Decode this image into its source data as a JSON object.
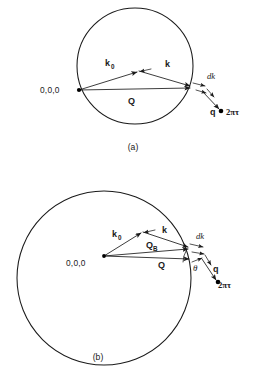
{
  "figure": {
    "background_color": "#ffffff",
    "stroke_color": "#1a1a1a",
    "width": 266,
    "height": 366
  },
  "panels": [
    {
      "id": "a",
      "caption": "(a)",
      "description": "Ewald construction with small sphere: incident wave vector k0 and scattered wave vector k from the origin, scattering vector Q, and deviation vector q to the reciprocal lattice point 2pi tau which lies outside the sphere.",
      "circle": {
        "cx": 135,
        "cy": 66,
        "r": 58
      },
      "origin": {
        "x": 79,
        "y": 90,
        "label": "0,0,0"
      },
      "apex": {
        "x": 139,
        "y": 71
      },
      "tip": {
        "x": 192,
        "y": 87
      },
      "lattice_point": {
        "x": 222,
        "y": 111,
        "label": "2πτ"
      },
      "labels": {
        "k0": "k",
        "k0_sub": "0",
        "k": "k",
        "Q": "Q",
        "dk": "dk",
        "q": "q",
        "origin": "0,0,0",
        "lattice": "2πτ"
      }
    },
    {
      "id": "b",
      "caption": "(b)",
      "description": "Ewald construction with large sphere: incident wave vector k0 and scattered wave vector k, Bragg scattering vector Q_B to the sphere surface, scattering vector Q, angle theta between Q and Q_B, deviation vector q to the reciprocal lattice point 2pi tau.",
      "circle": {
        "cx": 104,
        "cy": 278,
        "r": 87
      },
      "origin": {
        "x": 104,
        "y": 256,
        "label": "0,0,0"
      },
      "apex": {
        "x": 143,
        "y": 232
      },
      "tip_kb": {
        "x": 190,
        "y": 248
      },
      "tip_q": {
        "x": 191,
        "y": 259
      },
      "lattice_point": {
        "x": 219,
        "y": 283,
        "label": "2πτ"
      },
      "labels": {
        "k0": "k",
        "k0_sub": "0",
        "k": "k",
        "QB": "Q",
        "QB_sub": "B",
        "Q": "Q",
        "dk": "dk",
        "q": "q",
        "theta": "θ",
        "origin": "0,0,0",
        "lattice": "2πτ"
      }
    }
  ],
  "symbols": {
    "k0": "incident wave vector",
    "k": "scattered wave vector",
    "Q": "scattering vector",
    "QB": "Bragg scattering vector",
    "q": "deviation from reciprocal lattice point",
    "dk": "differential wave vector element",
    "theta": "scattering angle offset",
    "lattice_point": "reciprocal lattice point"
  }
}
